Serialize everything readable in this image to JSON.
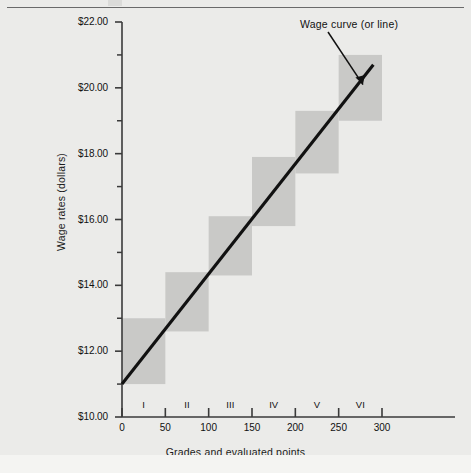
{
  "figure": {
    "background_color": "#ebebe9",
    "box_color": "#c9c9c7",
    "line_color": "#111111",
    "axis_color": "#3a3a3a"
  },
  "annotation": {
    "wage_curve_label": "Wage curve (or line)"
  },
  "axes": {
    "y_title": "Wage rates (dollars)",
    "x_title": "Grades and evaluated points",
    "y_tick_labels": [
      "$22.00",
      "$20.00",
      "$18.00",
      "$16.00",
      "$14.00",
      "$12.00",
      "$10.00"
    ],
    "y_tick_values": [
      22,
      20,
      18,
      16,
      14,
      12,
      10
    ],
    "y_minor_values": [
      21,
      19,
      17,
      15,
      13,
      11
    ],
    "x_tick_labels": [
      "0",
      "50",
      "100",
      "150",
      "200",
      "250",
      "300"
    ],
    "x_tick_values": [
      0,
      50,
      100,
      150,
      200,
      250,
      300
    ],
    "grade_labels": [
      "I",
      "II",
      "III",
      "IV",
      "V",
      "VI"
    ],
    "grade_centers": [
      25,
      75,
      125,
      175,
      225,
      275
    ]
  },
  "chart_data": {
    "type": "line",
    "title": "",
    "subtitle": "",
    "xlabel": "Grades and evaluated points",
    "ylabel": "Wage rates (dollars)",
    "xlim": [
      0,
      320
    ],
    "ylim": [
      10,
      22
    ],
    "grid": false,
    "legend": "none",
    "annotations": [
      {
        "text": "Wage curve (or line)",
        "points_to_x": 278,
        "points_to_y": 20.1
      }
    ],
    "series": [
      {
        "name": "Wage curve (or line)",
        "type": "line",
        "x": [
          0,
          290
        ],
        "y": [
          11.0,
          20.7
        ]
      }
    ],
    "grade_ranges": [
      {
        "grade": "I",
        "x_start": 0,
        "x_end": 50,
        "wage_min": 11.0,
        "wage_max": 13.0
      },
      {
        "grade": "II",
        "x_start": 50,
        "x_end": 100,
        "wage_min": 12.6,
        "wage_max": 14.4
      },
      {
        "grade": "III",
        "x_start": 100,
        "x_end": 150,
        "wage_min": 14.3,
        "wage_max": 16.1
      },
      {
        "grade": "IV",
        "x_start": 150,
        "x_end": 200,
        "wage_min": 15.8,
        "wage_max": 17.9
      },
      {
        "grade": "V",
        "x_start": 200,
        "x_end": 250,
        "wage_min": 17.4,
        "wage_max": 19.3
      },
      {
        "grade": "VI",
        "x_start": 250,
        "x_end": 300,
        "wage_min": 19.0,
        "wage_max": 21.0
      }
    ]
  }
}
